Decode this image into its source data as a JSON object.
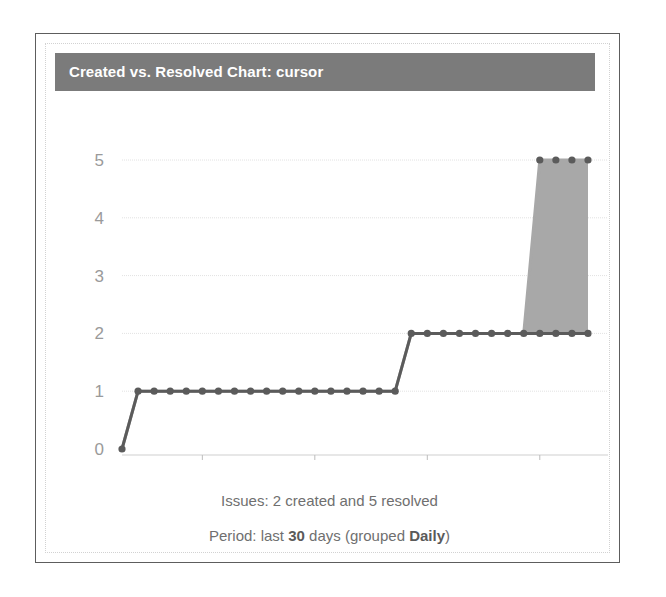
{
  "gadget": {
    "title": "Created vs. Resolved Chart: cursor",
    "header_color": "#7b7b7b",
    "border_color": "#5d5d5d"
  },
  "captions": {
    "issues_prefix": "Issues: ",
    "issues_created": "2",
    "issues_middle": " created and ",
    "issues_resolved": "5",
    "issues_suffix": " resolved",
    "issues_full": "Issues: 2 created and 5 resolved",
    "period_prefix": "Period: last ",
    "period_days": "30",
    "period_middle": " days (grouped ",
    "period_grouping": "Daily",
    "period_suffix": ")"
  },
  "chart_data": {
    "type": "area",
    "title": "Created vs. Resolved Chart: cursor",
    "xlabel": "",
    "ylabel": "",
    "ylim": [
      0,
      5
    ],
    "yticks": [
      0,
      1,
      2,
      3,
      4,
      5
    ],
    "ytick_labels": [
      "0",
      "1",
      "2",
      "3",
      "4",
      "5"
    ],
    "xtick_labels": [
      "14-Sep",
      "21-Sep",
      "28-Sep",
      "5-Oct"
    ],
    "xtick_indices": [
      5,
      12,
      19,
      26
    ],
    "grid": true,
    "legend": "none",
    "x": [
      "9-Sep",
      "10-Sep",
      "11-Sep",
      "12-Sep",
      "13-Sep",
      "14-Sep",
      "15-Sep",
      "16-Sep",
      "17-Sep",
      "18-Sep",
      "19-Sep",
      "20-Sep",
      "21-Sep",
      "22-Sep",
      "23-Sep",
      "24-Sep",
      "25-Sep",
      "26-Sep",
      "27-Sep",
      "28-Sep",
      "29-Sep",
      "30-Sep",
      "1-Oct",
      "2-Oct",
      "3-Oct",
      "4-Oct",
      "5-Oct",
      "6-Oct",
      "7-Oct",
      "8-Oct"
    ],
    "series": [
      {
        "name": "Resolved (cumulative upper)",
        "color": "#a8a8a8",
        "fill": "#a8a8a8",
        "values": [
          0,
          1,
          1,
          1,
          1,
          1,
          1,
          1,
          1,
          1,
          1,
          1,
          1,
          1,
          1,
          1,
          1,
          1,
          2,
          2,
          2,
          2,
          2,
          2,
          2,
          2,
          5,
          5,
          5,
          5
        ]
      },
      {
        "name": "Created (cumulative lower)",
        "color": "#5b5b5b",
        "marker": "circle",
        "values": [
          0,
          1,
          1,
          1,
          1,
          1,
          1,
          1,
          1,
          1,
          1,
          1,
          1,
          1,
          1,
          1,
          1,
          1,
          2,
          2,
          2,
          2,
          2,
          2,
          2,
          2,
          2,
          2,
          2,
          2
        ]
      }
    ]
  }
}
